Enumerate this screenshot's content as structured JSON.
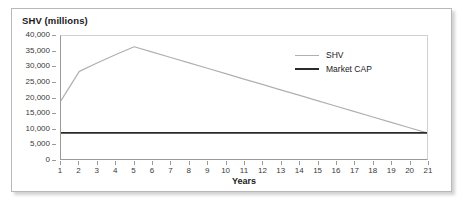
{
  "chart_data": {
    "type": "line",
    "title": "SHV (millions)",
    "xlabel": "Years",
    "ylabel": "SHV (millions)",
    "xlim": [
      1,
      21
    ],
    "ylim": [
      0,
      40000
    ],
    "grid": false,
    "legend_position": "top-right-inside",
    "x": [
      1,
      2,
      3,
      4,
      5,
      6,
      7,
      8,
      9,
      10,
      11,
      12,
      13,
      14,
      15,
      16,
      17,
      18,
      19,
      20,
      21
    ],
    "x_tick_labels": [
      "1",
      "2",
      "3",
      "4",
      "5",
      "6",
      "7",
      "8",
      "9",
      "10",
      "11",
      "12",
      "13",
      "14",
      "15",
      "16",
      "17",
      "18",
      "19",
      "20",
      "21"
    ],
    "y_ticks": [
      0,
      5000,
      10000,
      15000,
      20000,
      25000,
      30000,
      35000,
      40000
    ],
    "y_tick_labels": [
      "0",
      "5,000",
      "10,000",
      "15,000",
      "20,000",
      "25,000",
      "30,000",
      "35,000",
      "40,000"
    ],
    "series": [
      {
        "name": "SHV",
        "color": "#b0b0b0",
        "width": 1.2,
        "values": [
          19000,
          28500,
          31300,
          34000,
          36500,
          34750,
          33000,
          31250,
          29500,
          27750,
          26000,
          24250,
          22500,
          20750,
          19000,
          17250,
          15500,
          13750,
          12000,
          10250,
          8500
        ]
      },
      {
        "name": "Market CAP",
        "color": "#2b2b2b",
        "width": 1.6,
        "values": [
          8500,
          8500,
          8500,
          8500,
          8500,
          8500,
          8500,
          8500,
          8500,
          8500,
          8500,
          8500,
          8500,
          8500,
          8500,
          8500,
          8500,
          8500,
          8500,
          8500,
          8500
        ]
      }
    ]
  },
  "colors": {
    "frame_border": "#b8b8b8",
    "axis_line": "#9a9a9a",
    "tick_text": "#3a3a3a",
    "title_text": "#1a1a1a",
    "shv_line": "#b0b0b0",
    "market_cap_line": "#2b2b2b",
    "background": "#ffffff"
  }
}
